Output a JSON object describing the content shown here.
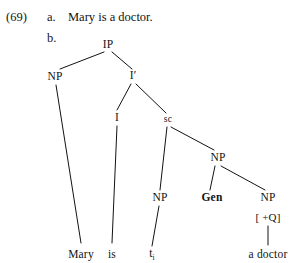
{
  "example": {
    "number": "(69)",
    "items": [
      {
        "marker": "a.",
        "text": "Mary is a doctor."
      },
      {
        "marker": "b.",
        "text": ""
      }
    ]
  },
  "tree": {
    "type": "syntax-tree",
    "style": {
      "ink": "#121212",
      "background": "#ffffff",
      "line_width": 1
    },
    "nodes": [
      {
        "id": "IP",
        "label": "IP",
        "x": 108,
        "y": 45,
        "style": "node"
      },
      {
        "id": "NP_subj",
        "label": "NP",
        "x": 55,
        "y": 77,
        "style": "node"
      },
      {
        "id": "Ibar",
        "label": "I′",
        "x": 133,
        "y": 76,
        "style": "node"
      },
      {
        "id": "I",
        "label": "I",
        "x": 117,
        "y": 118,
        "style": "node"
      },
      {
        "id": "sc",
        "label": "sc",
        "x": 168,
        "y": 120,
        "style": "node-sm"
      },
      {
        "id": "NP_pred",
        "label": "NP",
        "x": 218,
        "y": 158,
        "style": "node"
      },
      {
        "id": "NP_tr",
        "label": "NP",
        "x": 160,
        "y": 198,
        "style": "node"
      },
      {
        "id": "Gen",
        "label": "Gen",
        "x": 212,
        "y": 198,
        "style": "node-bold"
      },
      {
        "id": "NP_q",
        "label": "NP",
        "x": 268,
        "y": 198,
        "style": "node"
      },
      {
        "id": "Q_feat",
        "label": "[ +Q]",
        "x": 268,
        "y": 217,
        "style": "feat"
      }
    ],
    "terminals": [
      {
        "id": "t_mary",
        "label": "Mary",
        "sub": "",
        "x": 81,
        "y": 255
      },
      {
        "id": "t_is",
        "label": "is",
        "sub": "",
        "x": 112,
        "y": 255
      },
      {
        "id": "t_trace",
        "label": "t",
        "sub": "i",
        "x": 152,
        "y": 255
      },
      {
        "id": "t_doctor",
        "label": "a doctor",
        "sub": "",
        "x": 268,
        "y": 255
      }
    ],
    "edges": [
      {
        "from": "IP",
        "to": "NP_subj",
        "x1": 104,
        "y1": 52,
        "x2": 60,
        "y2": 69
      },
      {
        "from": "IP",
        "to": "Ibar",
        "x1": 112,
        "y1": 52,
        "x2": 132,
        "y2": 69
      },
      {
        "from": "NP_subj",
        "to": "t_mary",
        "x1": 56,
        "y1": 85,
        "x2": 81,
        "y2": 243
      },
      {
        "from": "Ibar",
        "to": "I",
        "x1": 131,
        "y1": 84,
        "x2": 117,
        "y2": 110
      },
      {
        "from": "Ibar",
        "to": "sc",
        "x1": 136,
        "y1": 84,
        "x2": 166,
        "y2": 113
      },
      {
        "from": "I",
        "to": "t_is",
        "x1": 117,
        "y1": 126,
        "x2": 112,
        "y2": 243
      },
      {
        "from": "sc",
        "to": "NP_tr",
        "x1": 167,
        "y1": 127,
        "x2": 160,
        "y2": 190
      },
      {
        "from": "sc",
        "to": "NP_pred",
        "x1": 171,
        "y1": 127,
        "x2": 214,
        "y2": 150
      },
      {
        "from": "NP_pred",
        "to": "Gen",
        "x1": 215,
        "y1": 166,
        "x2": 210,
        "y2": 190
      },
      {
        "from": "NP_pred",
        "to": "NP_q",
        "x1": 221,
        "y1": 166,
        "x2": 265,
        "y2": 190
      },
      {
        "from": "NP_tr",
        "to": "t_trace",
        "x1": 159,
        "y1": 206,
        "x2": 152,
        "y2": 246
      },
      {
        "from": "Q_feat",
        "to": "t_doctor",
        "x1": 268,
        "y1": 226,
        "x2": 268,
        "y2": 245
      }
    ]
  }
}
